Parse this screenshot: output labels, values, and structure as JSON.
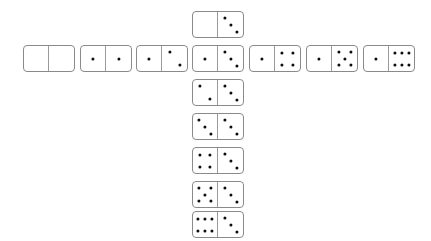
{
  "scene": {
    "title": "Domino cross layout",
    "background_color": "#ffffff",
    "tile_fill": "#ffffff",
    "tile_border_color": "#8a8a8a",
    "divider_color": "#9a9a9a",
    "pip_color": "#0d0d0d",
    "tile_width": 52,
    "tile_height": 27
  },
  "pip_layouts": {
    "0": [],
    "1": [
      [
        50,
        50
      ]
    ],
    "2": [
      [
        30,
        25
      ],
      [
        70,
        75
      ]
    ],
    "3": [
      [
        26,
        22
      ],
      [
        50,
        50
      ],
      [
        74,
        78
      ]
    ],
    "4": [
      [
        28,
        26
      ],
      [
        72,
        26
      ],
      [
        28,
        74
      ],
      [
        72,
        74
      ]
    ],
    "5": [
      [
        26,
        24
      ],
      [
        74,
        24
      ],
      [
        50,
        50
      ],
      [
        26,
        76
      ],
      [
        74,
        76
      ]
    ],
    "6": [
      [
        22,
        26
      ],
      [
        50,
        26
      ],
      [
        78,
        26
      ],
      [
        22,
        74
      ],
      [
        50,
        74
      ],
      [
        78,
        74
      ]
    ]
  },
  "dominoes": [
    {
      "id": "row-1-0",
      "name": "domino-1-0",
      "left": 0,
      "right": 0,
      "x": 23,
      "y": 45,
      "group": "row",
      "index": 0
    },
    {
      "id": "row-1-1",
      "name": "domino-1-1",
      "left": 1,
      "right": 1,
      "x": 80,
      "y": 45,
      "group": "row",
      "index": 1
    },
    {
      "id": "row-1-2",
      "name": "domino-1-2",
      "left": 1,
      "right": 2,
      "x": 136,
      "y": 45,
      "group": "row",
      "index": 2
    },
    {
      "id": "row-1-3",
      "name": "domino-1-3",
      "left": 1,
      "right": 3,
      "x": 192,
      "y": 45,
      "group": "row",
      "index": 3
    },
    {
      "id": "row-1-4",
      "name": "domino-1-4",
      "left": 1,
      "right": 4,
      "x": 249,
      "y": 45,
      "group": "row",
      "index": 4
    },
    {
      "id": "row-1-5",
      "name": "domino-1-5",
      "left": 1,
      "right": 5,
      "x": 306,
      "y": 45,
      "group": "row",
      "index": 5
    },
    {
      "id": "row-1-6",
      "name": "domino-1-6",
      "left": 1,
      "right": 6,
      "x": 363,
      "y": 45,
      "group": "row",
      "index": 6
    },
    {
      "id": "col-0-3",
      "name": "domino-0-3",
      "left": 0,
      "right": 3,
      "x": 192,
      "y": 11,
      "group": "column",
      "index": 0
    },
    {
      "id": "col-2-3",
      "name": "domino-2-3",
      "left": 2,
      "right": 3,
      "x": 192,
      "y": 79,
      "group": "column",
      "index": 1
    },
    {
      "id": "col-3-3",
      "name": "domino-3-3",
      "left": 3,
      "right": 3,
      "x": 192,
      "y": 113,
      "group": "column",
      "index": 2
    },
    {
      "id": "col-4-3",
      "name": "domino-4-3",
      "left": 4,
      "right": 3,
      "x": 192,
      "y": 147,
      "group": "column",
      "index": 3
    },
    {
      "id": "col-5-3",
      "name": "domino-5-3",
      "left": 5,
      "right": 3,
      "x": 192,
      "y": 181,
      "group": "column",
      "index": 4
    },
    {
      "id": "col-6-3",
      "name": "domino-6-3",
      "left": 6,
      "right": 3,
      "x": 192,
      "y": 211,
      "group": "column",
      "index": 5
    }
  ]
}
